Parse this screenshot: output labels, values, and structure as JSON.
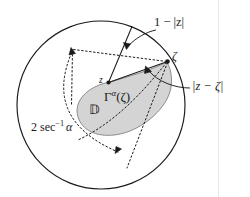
{
  "figure": {
    "background_color": "#ffffff",
    "ink_color": "#1a1a1a",
    "shade_color": "#d4d4d4",
    "shade_stroke_color": "#8c8c8c",
    "margin_rule_color": "#e8e8e8",
    "labels": {
      "one_minus_z": "1 − |z|",
      "z_minus_zeta": "|z − ζ|",
      "two_sec_inv_alpha_lead": "2 sec",
      "two_sec_inv_alpha_exponent": "−1",
      "two_sec_inv_alpha_tail": "α",
      "gamma_region": "Γα(ζ)",
      "gamma_symbol": "Γ",
      "gamma_subscript": "α",
      "gamma_argument": "(ζ)",
      "unit_disk": "𝔻",
      "point_z": "z",
      "point_zeta": "ζ"
    },
    "geometry": {
      "unit_circle": {
        "cx": 101,
        "cy": 105,
        "r": 84
      },
      "point_z": {
        "x": 108,
        "y": 82
      },
      "point_zeta": {
        "x": 168,
        "y": 61
      },
      "cone_half_angle_label": "2 sec−1 α"
    },
    "icons": {
      "arrow_to_one_minus_z": "arrow-icon",
      "arrow_to_z_minus_zeta": "arrow-icon",
      "arrow_angle_marker": "arrow-icon"
    }
  }
}
